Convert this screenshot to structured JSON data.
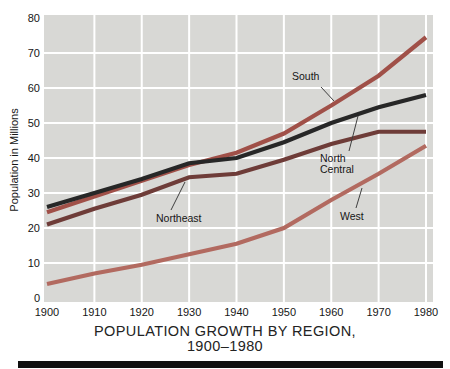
{
  "chart_data": {
    "type": "line",
    "title_line1": "POPULATION GROWTH BY REGION,",
    "title_line2": "1900–1980",
    "ylabel": "Population in Millions",
    "xlabel": "",
    "x": [
      1900,
      1910,
      1920,
      1930,
      1940,
      1950,
      1960,
      1970,
      1980
    ],
    "x_tick_labels": [
      "1900",
      "1910",
      "1920",
      "1930",
      "1940",
      "1950",
      "1960",
      "1970",
      "1980"
    ],
    "y_ticks": [
      0,
      10,
      20,
      30,
      40,
      50,
      60,
      70,
      80
    ],
    "ylim": [
      0,
      80
    ],
    "grid": true,
    "legend_position": "inline-annotations",
    "plot_bg": "#d8d8d5",
    "grid_color": "#ffffff",
    "series": [
      {
        "id": "west",
        "name": "West",
        "color": "#b26a60",
        "values": [
          4,
          7,
          9.5,
          12.5,
          15.5,
          20,
          28,
          35.5,
          43.5
        ]
      },
      {
        "id": "south",
        "name": "South",
        "color": "#a05048",
        "values": [
          24.5,
          29,
          33.5,
          38,
          41.5,
          47,
          55,
          63.5,
          74.5
        ]
      },
      {
        "id": "northeast",
        "name": "Northeast",
        "color": "#6e3c38",
        "values": [
          21,
          25.5,
          29.5,
          34.5,
          35.5,
          39.5,
          44,
          47.5,
          47.5
        ]
      },
      {
        "id": "north-central",
        "name": "North Central",
        "color": "#272727",
        "values": [
          26,
          30,
          34,
          38.5,
          40,
          44.5,
          50,
          54.5,
          58
        ]
      }
    ],
    "annotations": [
      {
        "id": "south",
        "lines": [
          "South"
        ],
        "x": 292,
        "y": 71,
        "leader": [
          321,
          87,
          334,
          101
        ]
      },
      {
        "id": "north-central",
        "lines": [
          "North",
          "Central"
        ],
        "x": 320,
        "y": 153,
        "leader": [
          349,
          151,
          358,
          116
        ]
      },
      {
        "id": "northeast",
        "lines": [
          "Northeast"
        ],
        "x": 156,
        "y": 213,
        "leader": [
          171,
          210,
          185,
          182
        ]
      },
      {
        "id": "west",
        "lines": [
          "West"
        ],
        "x": 340,
        "y": 211,
        "leader": [
          356,
          208,
          362,
          188
        ]
      }
    ]
  }
}
